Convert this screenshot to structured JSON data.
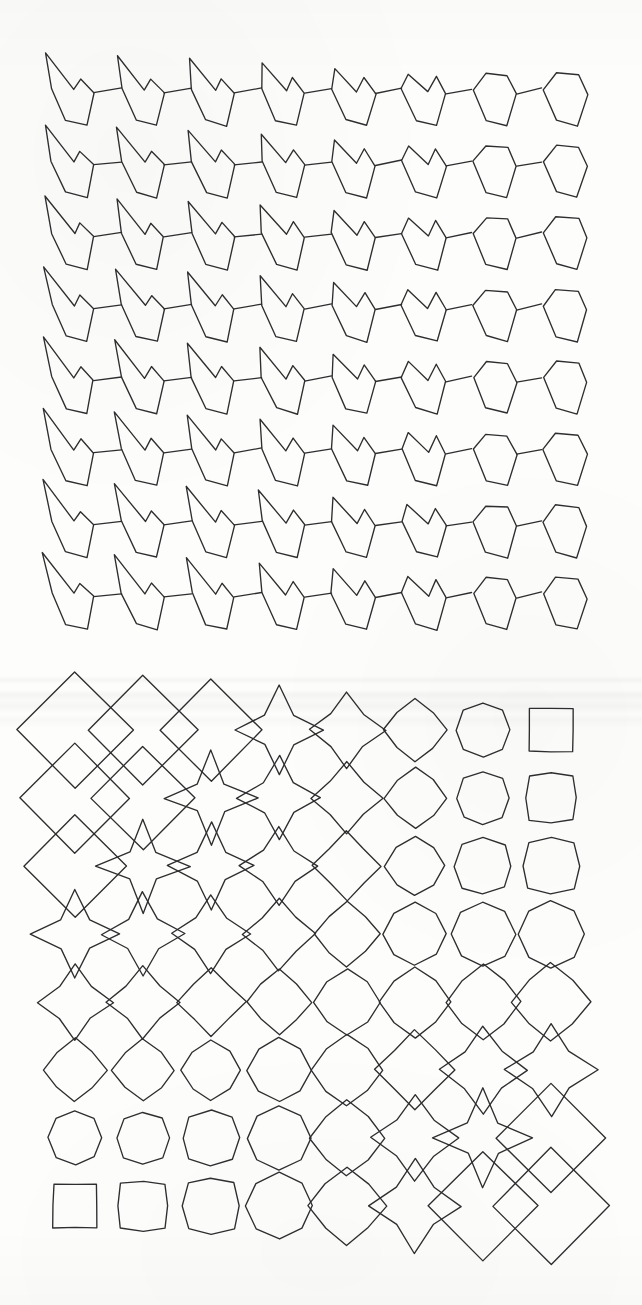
{
  "figure": {
    "title": "Shape interpolation grids",
    "background_color": "#fdfdfb",
    "stroke_color": "#2e2e30",
    "caption_top": "",
    "caption_bottom": ""
  },
  "panels": [
    {
      "id": "top-grid",
      "name": "spiky-polygon-morph-grid",
      "rows": 8,
      "cols": 8,
      "origin_x": 40,
      "origin_y": 62,
      "cell_w": 70,
      "cell_h": 72,
      "description": "8x8 grid of irregular spiky quadrilateral/pentagonal outlines that interpolate between a sharp barbed arrow form at the upper-left and a rounded blocky pentagon at the upper-right"
    },
    {
      "id": "bottom-grid",
      "name": "diamond-octagon-morph-grid",
      "rows": 8,
      "cols": 8,
      "origin_x": 75,
      "origin_y": 730,
      "cell_w": 68,
      "cell_h": 68,
      "description": "8x8 grid morphing along the anti-diagonal from a small axis-aligned square at the upper-right and lower-left corners to a large overlapping diamond at the upper-left and lower-right corners, passing through rounded octagons in between"
    }
  ],
  "chart_data": [
    {
      "type": "grid",
      "title": "Top grid: spiky polygon interpolation",
      "rows": 8,
      "cols": 8,
      "parameters": {
        "spike_length_by_col": [
          1.0,
          0.92,
          0.84,
          0.72,
          0.55,
          0.36,
          0.2,
          0.08
        ],
        "spike_length_by_row": [
          0.55,
          0.62,
          0.7,
          0.8,
          0.88,
          0.94,
          1.0,
          1.0
        ],
        "roundness_by_col": [
          0.0,
          0.08,
          0.16,
          0.28,
          0.45,
          0.62,
          0.78,
          0.9
        ]
      }
    },
    {
      "type": "grid",
      "title": "Bottom grid: square to diamond interpolation",
      "rows": 8,
      "cols": 8,
      "size_matrix": [
        [
          0.98,
          0.88,
          0.78,
          0.66,
          0.54,
          0.42,
          0.32,
          0.24
        ],
        [
          0.88,
          0.8,
          0.71,
          0.61,
          0.5,
          0.4,
          0.31,
          0.32
        ],
        [
          0.78,
          0.71,
          0.64,
          0.56,
          0.47,
          0.39,
          0.4,
          0.42
        ],
        [
          0.66,
          0.61,
          0.56,
          0.5,
          0.44,
          0.47,
          0.5,
          0.54
        ],
        [
          0.54,
          0.5,
          0.47,
          0.44,
          0.5,
          0.56,
          0.61,
          0.66
        ],
        [
          0.42,
          0.4,
          0.39,
          0.47,
          0.56,
          0.64,
          0.71,
          0.78
        ],
        [
          0.32,
          0.31,
          0.4,
          0.5,
          0.61,
          0.71,
          0.8,
          0.88
        ],
        [
          0.24,
          0.32,
          0.42,
          0.54,
          0.66,
          0.78,
          0.88,
          0.98
        ]
      ],
      "diamondness_matrix": [
        [
          1.0,
          0.93,
          0.84,
          0.72,
          0.58,
          0.42,
          0.24,
          0.0
        ],
        [
          0.93,
          0.86,
          0.78,
          0.67,
          0.54,
          0.39,
          0.22,
          0.08
        ],
        [
          0.84,
          0.78,
          0.71,
          0.61,
          0.49,
          0.35,
          0.2,
          0.16
        ],
        [
          0.72,
          0.67,
          0.61,
          0.53,
          0.43,
          0.31,
          0.28,
          0.28
        ],
        [
          0.58,
          0.54,
          0.49,
          0.43,
          0.36,
          0.38,
          0.4,
          0.42
        ],
        [
          0.42,
          0.39,
          0.35,
          0.31,
          0.38,
          0.48,
          0.58,
          0.62
        ],
        [
          0.24,
          0.22,
          0.2,
          0.28,
          0.4,
          0.58,
          0.75,
          0.84
        ],
        [
          0.0,
          0.08,
          0.16,
          0.28,
          0.42,
          0.62,
          0.84,
          1.0
        ]
      ],
      "corner_shapes": {
        "top_left": "large-diamond",
        "top_right": "small-square",
        "bottom_left": "small-square",
        "bottom_right": "large-diamond",
        "middle": "rounded-octagon"
      }
    }
  ]
}
